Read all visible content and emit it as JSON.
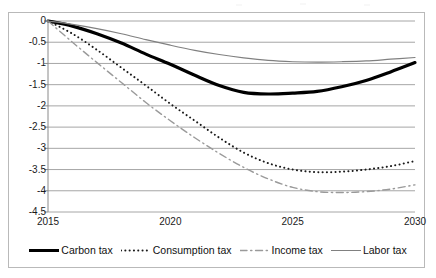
{
  "chart_data": {
    "type": "line",
    "title": "",
    "subtitle": "",
    "xlabel": "",
    "ylabel": "",
    "xlim": [
      2015,
      2030
    ],
    "ylim": [
      -4.5,
      0
    ],
    "grid": true,
    "grid_axis": "y",
    "legend_position": "bottom",
    "x": [
      2015,
      2016,
      2017,
      2018,
      2019,
      2020,
      2021,
      2022,
      2023,
      2024,
      2025,
      2026,
      2027,
      2028,
      2029,
      2030
    ],
    "xticks": [
      "2015",
      "2020",
      "2025",
      "2030"
    ],
    "xtick_values": [
      2015,
      2020,
      2025,
      2030
    ],
    "yticks": [
      "0",
      "-0.5",
      "-1",
      "-1.5",
      "-2",
      "-2.5",
      "-3",
      "-3.5",
      "-4",
      "-4.5"
    ],
    "ytick_values": [
      0,
      -0.5,
      -1,
      -1.5,
      -2,
      -2.5,
      -3,
      -3.5,
      -4,
      -4.5
    ],
    "series": [
      {
        "name": "Carbon tax",
        "style": "solid-thick",
        "color": "#000000",
        "width": 3.2,
        "values": [
          0.0,
          -0.12,
          -0.3,
          -0.52,
          -0.78,
          -1.02,
          -1.28,
          -1.52,
          -1.68,
          -1.72,
          -1.7,
          -1.66,
          -1.55,
          -1.4,
          -1.2,
          -0.98
        ]
      },
      {
        "name": "Consumption tax",
        "style": "dotted",
        "color": "#1a1a1a",
        "width": 2.0,
        "values": [
          0.0,
          -0.3,
          -0.68,
          -1.1,
          -1.52,
          -1.95,
          -2.35,
          -2.75,
          -3.1,
          -3.35,
          -3.5,
          -3.56,
          -3.55,
          -3.5,
          -3.42,
          -3.3
        ]
      },
      {
        "name": "Income tax",
        "style": "dash-dot",
        "color": "#9a9a9a",
        "width": 1.4,
        "values": [
          0.0,
          -0.5,
          -0.98,
          -1.45,
          -1.92,
          -2.35,
          -2.75,
          -3.12,
          -3.45,
          -3.72,
          -3.92,
          -4.02,
          -4.04,
          -4.02,
          -3.96,
          -3.86
        ]
      },
      {
        "name": "Labor tax",
        "style": "solid-thin",
        "color": "#808080",
        "width": 1.2,
        "values": [
          0.0,
          -0.08,
          -0.18,
          -0.3,
          -0.44,
          -0.57,
          -0.69,
          -0.79,
          -0.87,
          -0.93,
          -0.96,
          -0.97,
          -0.96,
          -0.94,
          -0.9,
          -0.86
        ]
      }
    ]
  },
  "legend": {
    "items": [
      {
        "label": "Carbon tax",
        "swatch": "solid-thick-line-swatch"
      },
      {
        "label": "Consumption tax",
        "swatch": "dotted-line-swatch"
      },
      {
        "label": "Income tax",
        "swatch": "dash-dot-line-swatch"
      },
      {
        "label": "Labor tax",
        "swatch": "solid-thin-line-swatch"
      }
    ]
  },
  "colors": {
    "frame": "#b9b9b9",
    "gridline": "#a6a6a6",
    "axis_text": "#1a1a1a",
    "background": "#ffffff"
  }
}
